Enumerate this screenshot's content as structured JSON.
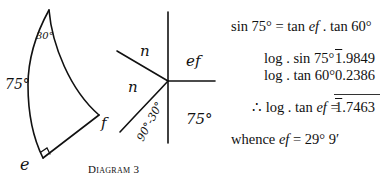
{
  "diagram": {
    "caption": "Diagram 3",
    "triangle": {
      "vertices": [
        "apex",
        "e",
        "f"
      ],
      "labels": {
        "apex_angle": "30°",
        "side_left": "75°",
        "vertex_e": "e",
        "vertex_f": "f"
      },
      "right_angle_at": "e"
    },
    "napier_circle": {
      "parts": {
        "upper_left": "n",
        "middle_left": "n",
        "lower_left": "90°-30°",
        "upper_right": "ef",
        "lower_right": "75°"
      }
    }
  },
  "equations": {
    "line1": {
      "lhs": "sin 75°",
      "eq": "=",
      "rhs_pre": "tan ",
      "rhs_var": "ef",
      "rhs_post": " . tan 60°"
    },
    "line2": {
      "label": "log . sin 75°",
      "bar_digit": "1",
      "rest": ".9849"
    },
    "line3": {
      "label": "log . tan 60°",
      "value": "0.2386"
    },
    "line4": {
      "label_pre": "∴ log . tan ",
      "label_var": "ef",
      "eq": " =",
      "bar_digit": "1",
      "rest": ".7463"
    },
    "line5": {
      "pre": "whence ",
      "var": "ef",
      "post": " = 29° 9′"
    }
  }
}
